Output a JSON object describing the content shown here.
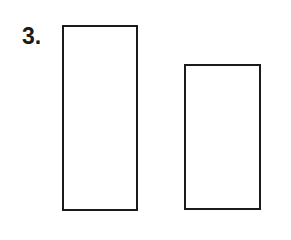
{
  "problem": {
    "number_label": "3."
  },
  "shapes": [
    {
      "type": "rectangle",
      "role": "tall-rectangle",
      "fill": "#ffffff",
      "stroke": "#1a1a1a"
    },
    {
      "type": "rectangle",
      "role": "short-rectangle",
      "fill": "#ffffff",
      "stroke": "#1a1a1a"
    }
  ]
}
